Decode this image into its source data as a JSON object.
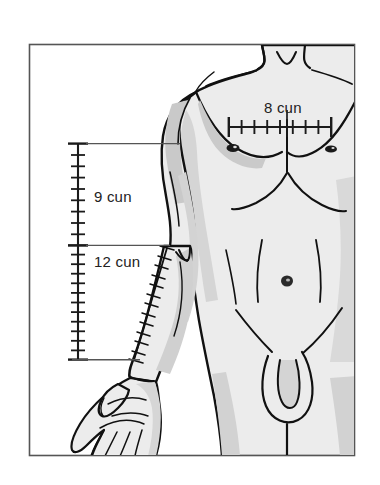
{
  "figure": {
    "frame": {
      "border_color": "#555555",
      "background_color": "#ffffff",
      "x": 29,
      "y": 44,
      "width": 326,
      "height": 412
    },
    "colors": {
      "skin_fill": "#ececec",
      "shadow_fill": "#c9c9c9",
      "deep_shadow_fill": "#b4b4b4",
      "outline": "#111111",
      "ruler": "#222222",
      "label_text": "#222222",
      "leader_line": "#555555"
    }
  },
  "measurements": [
    {
      "id": "chest-8-cun",
      "label": "8 cun",
      "value": 8,
      "unit": "cun",
      "orientation": "horizontal",
      "region": "chest between nipples",
      "tick_count": 9,
      "interval_count": 8,
      "ruler": {
        "x1": 228,
        "y1": 127,
        "x2": 332,
        "y2": 127
      },
      "label_position": {
        "x": 264,
        "y": 108
      }
    },
    {
      "id": "upper-arm-9-cun",
      "label": "9 cun",
      "value": 9,
      "unit": "cun",
      "orientation": "vertical",
      "region": "axilla to elbow crease",
      "tick_count": 10,
      "interval_count": 9,
      "ruler": {
        "x1": 78,
        "y1": 143,
        "x2": 78,
        "y2": 245
      },
      "label_position": {
        "x": 94,
        "y": 197
      }
    },
    {
      "id": "forearm-12-cun",
      "label": "12 cun",
      "value": 12,
      "unit": "cun",
      "orientation": "vertical",
      "region": "elbow crease to wrist crease",
      "tick_count": 13,
      "interval_count": 12,
      "ruler": {
        "x1": 78,
        "y1": 245,
        "x2": 78,
        "y2": 360
      },
      "label_position": {
        "x": 94,
        "y": 262
      }
    }
  ],
  "leader_lines": [
    {
      "id": "axilla-leader",
      "x1": 86,
      "y1": 143,
      "x2": 178,
      "y2": 143
    },
    {
      "id": "elbow-leader",
      "x1": 86,
      "y1": 245,
      "x2": 168,
      "y2": 245
    },
    {
      "id": "wrist-leader",
      "x1": 70,
      "y1": 360,
      "x2": 138,
      "y2": 360
    }
  ],
  "anatomy_landmarks": [
    {
      "id": "nipple-left",
      "cx": 233,
      "cy": 148
    },
    {
      "id": "nipple-right",
      "cx": 330,
      "cy": 149
    },
    {
      "id": "navel",
      "cx": 287,
      "cy": 281
    },
    {
      "id": "sternal-notch",
      "cx": 287,
      "cy": 48
    },
    {
      "id": "wrist-crease",
      "cx": 132,
      "cy": 361
    },
    {
      "id": "elbow-crease",
      "cx": 164,
      "cy": 247
    }
  ]
}
